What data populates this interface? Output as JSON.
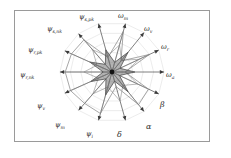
{
  "figure": {
    "background_color": "#ffffff",
    "border_color": "#9a9a9a",
    "grid_color": "#cfcfcf",
    "axis_color": "#3a3a3a",
    "series_dark_color": "#4a4a4a",
    "series_light_color": "#8a8a8a",
    "center_dot_color": "#111111"
  },
  "chart_data": {
    "type": "radar",
    "title": "",
    "subtitle": "",
    "xlabel": "",
    "ylabel": "",
    "grid": true,
    "legend_position": "none",
    "rings": 5,
    "rlim": [
      0,
      1
    ],
    "categories": [
      "omega_m",
      "omega_v",
      "omega_r",
      "omega_a",
      "beta",
      "alpha",
      "delta",
      "psi_i",
      "psi_m",
      "psi_v",
      "psi_r_nk",
      "psi_r_pk",
      "psi_s_nk",
      "psi_s_pk"
    ],
    "axis_labels": [
      {
        "key": "psi_s_pk",
        "base": "ψ",
        "sub": "s,pk",
        "angle_deg": 105,
        "x": 79,
        "y": 14
      },
      {
        "key": "omega_m",
        "base": "ω",
        "sub": "m",
        "angle_deg": 75,
        "x": 118,
        "y": 13
      },
      {
        "key": "omega_v",
        "base": "ω",
        "sub": "v",
        "angle_deg": 52,
        "x": 144,
        "y": 26
      },
      {
        "key": "omega_r",
        "base": "ω",
        "sub": "r",
        "angle_deg": 26,
        "x": 161,
        "y": 44
      },
      {
        "key": "omega_a",
        "base": "ω",
        "sub": "a",
        "angle_deg": 0,
        "x": 166,
        "y": 72
      },
      {
        "key": "beta",
        "base": "β",
        "sub": "",
        "angle_deg": -26,
        "x": 160,
        "y": 101
      },
      {
        "key": "alpha",
        "base": "α",
        "sub": "",
        "angle_deg": -52,
        "x": 146,
        "y": 123
      },
      {
        "key": "delta",
        "base": "δ",
        "sub": "",
        "angle_deg": -75,
        "x": 117,
        "y": 131
      },
      {
        "key": "psi_i",
        "base": "ψ",
        "sub": "i",
        "angle_deg": -105,
        "x": 86,
        "y": 131
      },
      {
        "key": "psi_m",
        "base": "ψ",
        "sub": "m",
        "angle_deg": -130,
        "x": 55,
        "y": 122
      },
      {
        "key": "psi_v",
        "base": "ψ",
        "sub": "v",
        "angle_deg": -155,
        "x": 37,
        "y": 103
      },
      {
        "key": "psi_r_nk",
        "base": "ψ",
        "sub": "r,nk",
        "angle_deg": 180,
        "x": 20,
        "y": 72
      },
      {
        "key": "psi_r_pk",
        "base": "ψ",
        "sub": "r,pk",
        "angle_deg": 155,
        "x": 28,
        "y": 47
      },
      {
        "key": "psi_s_nk",
        "base": "ψ",
        "sub": "s,nk",
        "angle_deg": 130,
        "x": 47,
        "y": 26
      }
    ],
    "series": [
      {
        "name": "inner-star",
        "style": "dark-filled",
        "values": [
          0.46,
          0.2,
          0.5,
          0.17,
          0.44,
          0.16,
          0.5,
          0.19,
          0.48,
          0.18,
          0.45,
          0.17,
          0.47,
          0.2
        ]
      },
      {
        "name": "mid-outline",
        "style": "medium",
        "values": [
          0.33,
          0.56,
          0.3,
          0.58,
          0.26,
          0.55,
          0.34,
          0.6,
          0.31,
          0.57,
          0.29,
          0.54,
          0.32,
          0.58
        ]
      },
      {
        "name": "outer-outline",
        "style": "light",
        "values": [
          0.3,
          0.84,
          0.28,
          0.8,
          0.25,
          0.78,
          0.83,
          0.3,
          0.86,
          0.82,
          0.88,
          0.9,
          0.86,
          0.84
        ]
      }
    ],
    "annotations": []
  }
}
